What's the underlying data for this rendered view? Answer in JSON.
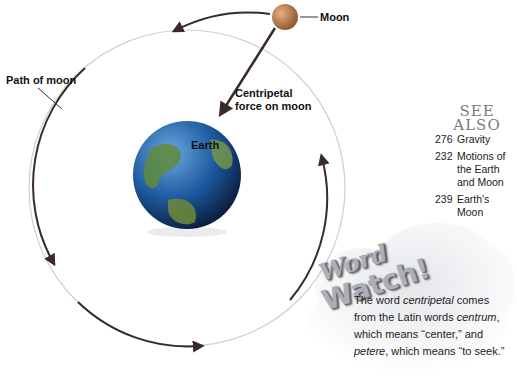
{
  "diagram": {
    "labels": {
      "moon": "Moon",
      "path_of_moon": "Path of moon",
      "centripetal_line1": "Centripetal",
      "centripetal_line2": "force on moon",
      "earth": "Earth"
    },
    "colors": {
      "arrow": "#3a2a2a",
      "orbit": "#8a8a8a",
      "moon": "#c98a52",
      "earth_ocean": "#1f5fa8",
      "earth_land": "#5f8a3a"
    }
  },
  "see_also": {
    "title_line1": "SEE",
    "title_line2": "ALSO",
    "items": [
      {
        "page": "276",
        "text": "Gravity"
      },
      {
        "page": "232",
        "text": "Motions of the Earth and Moon"
      },
      {
        "page": "239",
        "text": "Earth's Moon"
      }
    ]
  },
  "word_watch": {
    "title_line1": "Word",
    "title_line2": "Watch!",
    "text_parts": {
      "p1": "The word ",
      "i1": "centripetal",
      "p2": " comes from the Latin words ",
      "i2": "centrum",
      "p3": ", which means “center,” and ",
      "i3": "petere",
      "p4": ", which means “to seek.”"
    }
  }
}
